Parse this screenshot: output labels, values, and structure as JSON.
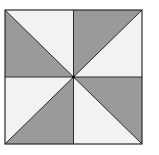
{
  "diagram": {
    "type": "pinwheel-quilt-block",
    "square": {
      "left": 5,
      "top": 10,
      "right": 142,
      "bottom": 144
    },
    "center": {
      "x": 73.5,
      "y": 77
    },
    "colors": {
      "shaded": "#9a9a9a",
      "light": "#f2f2f2",
      "line": "#2a2a2a",
      "background": "#ffffff"
    },
    "regions": [
      {
        "quadrant": "top-left",
        "shaded_triangle": "lower"
      },
      {
        "quadrant": "top-right",
        "shaded_triangle": "upper"
      },
      {
        "quadrant": "bottom-right",
        "shaded_triangle": "upper"
      },
      {
        "quadrant": "bottom-left",
        "shaded_triangle": "lower"
      }
    ]
  }
}
